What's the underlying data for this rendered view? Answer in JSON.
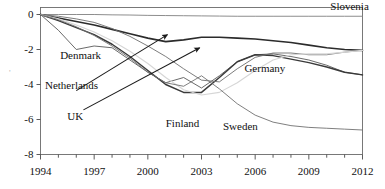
{
  "chart_data": {
    "type": "line",
    "title": "",
    "xlabel": "",
    "ylabel": "",
    "xlim": [
      1994,
      2012
    ],
    "ylim": [
      -8,
      0.4
    ],
    "grid": false,
    "legend_position": "inline-labels",
    "x_ticks": [
      "1994",
      "1997",
      "2000",
      "2003",
      "2006",
      "2009",
      "2012"
    ],
    "x_tick_values": [
      1994,
      1997,
      2000,
      2003,
      2006,
      2009,
      2012
    ],
    "x_minor_step": 1,
    "y_ticks": [
      "0",
      "-2",
      "-4",
      "-6",
      "-8"
    ],
    "y_tick_values": [
      0,
      -2,
      -4,
      -6,
      -8
    ],
    "x": [
      1994,
      1995,
      1996,
      1997,
      1998,
      1999,
      2000,
      2001,
      2002,
      2003,
      2004,
      2005,
      2006,
      2007,
      2008,
      2009,
      2010,
      2011,
      2012
    ],
    "series": [
      {
        "name": "Slovenia",
        "color": "#808080",
        "width": 0.9,
        "label_x": 2010.2,
        "label_y": 0.28,
        "values": [
          0,
          0,
          0,
          0,
          -0.02,
          -0.03,
          -0.05,
          -0.06,
          -0.07,
          -0.08,
          -0.09,
          -0.1,
          -0.1,
          -0.1,
          -0.1,
          -0.1,
          -0.1,
          -0.1,
          -0.1
        ]
      },
      {
        "name": "Denmark",
        "color": "#595959",
        "width": 0.9,
        "label_x": 1995.1,
        "label_y": -2.55,
        "values": [
          0,
          -0.9,
          -2.0,
          -1.8,
          -1.9,
          -2.6,
          -3.3,
          -3.9,
          -3.6,
          -4.2,
          -3.5,
          -2.7,
          -2.3,
          -2.25,
          -2.4,
          -2.6,
          -2.9,
          -3.3,
          -3.45
        ]
      },
      {
        "name": "Netherlands",
        "color": "#3a3a3a",
        "width": 1.5,
        "label_x": 1994.25,
        "label_y": -4.25,
        "values": [
          0,
          -0.35,
          -0.75,
          -1.15,
          -1.7,
          -2.4,
          -3.2,
          -4.0,
          -4.45,
          -4.45,
          -3.6,
          -2.7,
          -2.3,
          -2.35,
          -2.55,
          -2.75,
          -3.0,
          -3.3,
          -3.45
        ]
      },
      {
        "name": "UK",
        "color": "#2b2b2b",
        "width": 1.6,
        "label_x": 1995.5,
        "label_y": -6.05,
        "values": [
          0,
          -0.2,
          -0.4,
          -0.6,
          -0.85,
          -1.1,
          -1.35,
          -1.55,
          -1.45,
          -1.3,
          -1.3,
          -1.35,
          -1.4,
          -1.5,
          -1.6,
          -1.75,
          -1.9,
          -2.0,
          -2.05
        ]
      },
      {
        "name": "Germany",
        "color": "#6e6e6e",
        "width": 0.9,
        "label_x": 2005.4,
        "label_y": -3.3,
        "values": [
          0,
          -0.1,
          -0.25,
          -0.45,
          -0.8,
          -1.25,
          -1.8,
          -2.4,
          -3.1,
          -3.75,
          -3.85,
          -3.1,
          -2.45,
          -2.2,
          -2.2,
          -2.3,
          -2.3,
          -2.15,
          -2.05
        ]
      },
      {
        "name": "Finland",
        "color": "#d6d6d6",
        "width": 1.1,
        "label_x": 2001.0,
        "label_y": -6.45,
        "values": [
          0,
          -0.25,
          -0.6,
          -1.0,
          -1.5,
          -2.1,
          -2.8,
          -3.6,
          -4.3,
          -4.6,
          -4.45,
          -3.9,
          -3.2,
          -2.6,
          -2.3,
          -2.25,
          -2.25,
          -2.15,
          -2.05
        ]
      },
      {
        "name": "Sweden",
        "color": "#707070",
        "width": 0.9,
        "label_x": 2004.2,
        "label_y": -6.6,
        "values": [
          0,
          -0.3,
          -0.7,
          -1.2,
          -1.8,
          -2.5,
          -3.3,
          -3.9,
          -4.1,
          -3.5,
          -4.25,
          -5.1,
          -5.75,
          -6.15,
          -6.35,
          -6.45,
          -6.5,
          -6.55,
          -6.6
        ]
      }
    ],
    "annotations": [
      {
        "name": "netherlands-arrow",
        "from_x": 1996.0,
        "from_y": -4.35,
        "to_x": 2001.1,
        "to_y": -1.15
      },
      {
        "name": "uk-arrow",
        "from_x": 1996.4,
        "from_y": -5.45,
        "to_x": 2002.9,
        "to_y": -1.9
      }
    ],
    "stray_mark": "'"
  }
}
